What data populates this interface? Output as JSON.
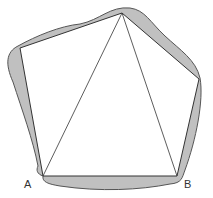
{
  "diagram": {
    "type": "geometry",
    "labels": {
      "A": "A",
      "B": "B"
    },
    "vertices": {
      "A": [
        43,
        176
      ],
      "B": [
        177,
        176
      ],
      "top": [
        122,
        13
      ],
      "upper_left": [
        20,
        48
      ],
      "right": [
        199,
        79
      ]
    },
    "colors": {
      "shade": "#c0c0c0",
      "stroke": "#333333",
      "background": "#ffffff"
    }
  }
}
